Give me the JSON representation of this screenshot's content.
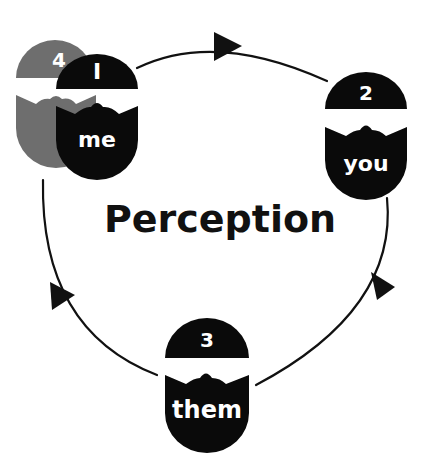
{
  "diagram": {
    "title": "Perception",
    "cycle_direction": "clockwise",
    "colors": {
      "primary": "#0a0a0a",
      "faded": "#6e6e6e",
      "text_on_figure": "#ffffff",
      "line": "#111111"
    },
    "figures": [
      {
        "id": "me",
        "number": "I",
        "label": "me",
        "style": "primary",
        "position": "top-left"
      },
      {
        "id": "you",
        "number": "2",
        "label": "you",
        "style": "primary",
        "position": "right"
      },
      {
        "id": "them",
        "number": "3",
        "label": "them",
        "style": "primary",
        "position": "bottom"
      },
      {
        "id": "me-return",
        "number": "4",
        "label": "",
        "style": "faded",
        "position": "top-left-behind"
      }
    ],
    "arrows": [
      {
        "from": "me",
        "to": "you",
        "position": "top"
      },
      {
        "from": "you",
        "to": "them",
        "position": "right"
      },
      {
        "from": "them",
        "to": "me",
        "position": "left"
      }
    ]
  }
}
